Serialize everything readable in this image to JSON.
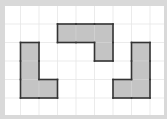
{
  "figure": {
    "colors": {
      "frame": "#d9d9d9",
      "background": "#ffffff",
      "grid": "#e6e6e6",
      "shape_fill": "#c4c4c4",
      "shape_stroke": "#333333",
      "inner_grid": "#d2d2d2"
    },
    "grid": {
      "cell_size": 18.5,
      "origin_x": 2,
      "origin_y": 5.5,
      "cols": 9,
      "rows": 6
    },
    "shapes": [
      {
        "name": "left-l-shape",
        "cells": [
          [
            1,
            2
          ],
          [
            1,
            3
          ],
          [
            1,
            4
          ],
          [
            2,
            4
          ]
        ]
      },
      {
        "name": "top-center-shape",
        "cells": [
          [
            3,
            1
          ],
          [
            4,
            1
          ],
          [
            5,
            1
          ],
          [
            5,
            2
          ]
        ]
      },
      {
        "name": "right-j-shape",
        "cells": [
          [
            7,
            2
          ],
          [
            7,
            3
          ],
          [
            7,
            4
          ],
          [
            6,
            4
          ]
        ]
      }
    ]
  }
}
